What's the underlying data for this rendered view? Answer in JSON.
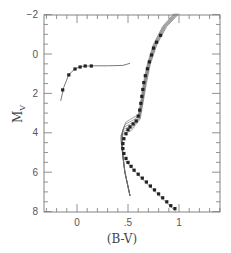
{
  "chart_data": {
    "type": "scatter",
    "title": "",
    "xlabel": "(B-V)",
    "ylabel": "M_V",
    "xlim": [
      -0.33,
      1.41
    ],
    "ylim": [
      8,
      -2
    ],
    "y_inverted": true,
    "grid": false,
    "legend": null,
    "xticks": [
      {
        "value": 0,
        "label": "0"
      },
      {
        "value": 0.5,
        "label": ".5"
      },
      {
        "value": 1,
        "label": "1"
      }
    ],
    "yticks": [
      {
        "value": -2,
        "label": "-2"
      },
      {
        "value": 0,
        "label": "0"
      },
      {
        "value": 2,
        "label": "2"
      },
      {
        "value": 4,
        "label": "4"
      },
      {
        "value": 6,
        "label": "6"
      },
      {
        "value": 8,
        "label": "8"
      }
    ],
    "series": [
      {
        "name": "horizontal-branch-points",
        "kind": "scatter",
        "points": [
          [
            -0.14,
            1.82
          ],
          [
            -0.08,
            1.06
          ],
          [
            -0.02,
            0.76
          ],
          [
            0.03,
            0.66
          ],
          [
            0.08,
            0.61
          ],
          [
            0.14,
            0.61
          ]
        ]
      },
      {
        "name": "horizontal-branch-model",
        "kind": "line",
        "points": [
          [
            -0.16,
            2.38
          ],
          [
            -0.13,
            1.7
          ],
          [
            -0.08,
            1.05
          ],
          [
            -0.02,
            0.75
          ],
          [
            0.04,
            0.63
          ],
          [
            0.15,
            0.6
          ],
          [
            0.3,
            0.6
          ],
          [
            0.45,
            0.58
          ],
          [
            0.52,
            0.47
          ]
        ]
      },
      {
        "name": "fiducial-sequence-points",
        "kind": "scatter",
        "points": [
          [
            0.82,
            -0.95
          ],
          [
            0.78,
            -0.6
          ],
          [
            0.75,
            -0.3
          ],
          [
            0.73,
            0.05
          ],
          [
            0.71,
            0.4
          ],
          [
            0.69,
            0.75
          ],
          [
            0.67,
            1.1
          ],
          [
            0.655,
            1.45
          ],
          [
            0.645,
            1.8
          ],
          [
            0.635,
            2.15
          ],
          [
            0.625,
            2.5
          ],
          [
            0.615,
            2.85
          ],
          [
            0.6,
            3.15
          ],
          [
            0.58,
            3.4
          ],
          [
            0.55,
            3.55
          ],
          [
            0.52,
            3.7
          ],
          [
            0.5,
            3.85
          ],
          [
            0.48,
            4.05
          ],
          [
            0.46,
            4.3
          ],
          [
            0.45,
            4.55
          ],
          [
            0.45,
            4.8
          ],
          [
            0.46,
            5.05
          ],
          [
            0.48,
            5.3
          ],
          [
            0.5,
            5.5
          ],
          [
            0.53,
            5.7
          ],
          [
            0.56,
            5.9
          ],
          [
            0.6,
            6.1
          ],
          [
            0.64,
            6.3
          ],
          [
            0.68,
            6.5
          ],
          [
            0.72,
            6.7
          ],
          [
            0.76,
            6.9
          ],
          [
            0.8,
            7.1
          ],
          [
            0.84,
            7.3
          ],
          [
            0.88,
            7.5
          ],
          [
            0.92,
            7.7
          ],
          [
            0.96,
            7.85
          ]
        ]
      },
      {
        "name": "isochrone-bundle",
        "kind": "lines",
        "count": 6,
        "description": "Family of theoretical isochrones (different ages) tracing turnoff, subgiant branch and red giant branch"
      }
    ],
    "annotations": []
  }
}
